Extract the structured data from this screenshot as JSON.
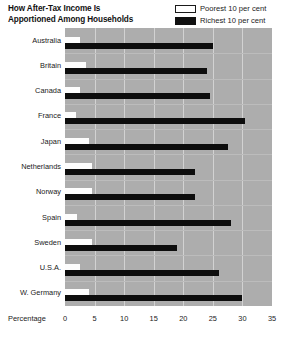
{
  "header": {
    "title_lines": [
      "How After-Tax Income Is",
      "Apportioned Among Households"
    ],
    "legend": [
      {
        "label": "Poorest 10 per cent",
        "swatch": "hollow-white-box",
        "color": "#ffffff"
      },
      {
        "label": "Richest 10 per cent",
        "swatch": "solid-black-box",
        "color": "#111111"
      }
    ]
  },
  "axis": {
    "title": "Percentage",
    "ticks": [
      "0",
      "5",
      "10",
      "15",
      "20",
      "25",
      "30",
      "35"
    ]
  },
  "colors": {
    "plot_background": "#adadad",
    "gridline": "#d2d2d2",
    "poorest_bar": "#fdfdfd",
    "richest_bar": "#0d0d0d",
    "text": "#1a1a1a"
  },
  "chart_data": {
    "type": "bar",
    "orientation": "horizontal",
    "title": "How After-Tax Income Is Apportioned Among Households",
    "xlabel": "Percentage",
    "ylabel": "",
    "xlim": [
      0,
      35
    ],
    "xticks": [
      0,
      5,
      10,
      15,
      20,
      25,
      30,
      35
    ],
    "grid": true,
    "legend_position": "top-right",
    "categories": [
      "Australia",
      "Britain",
      "Canada",
      "France",
      "Japan",
      "Netherlands",
      "Norway",
      "Spain",
      "Sweden",
      "U.S.A.",
      "W. Germany"
    ],
    "series": [
      {
        "name": "Poorest 10 per cent",
        "color": "#ffffff",
        "values": [
          2.5,
          3.5,
          2.5,
          1.8,
          4.0,
          4.5,
          4.5,
          2.0,
          4.5,
          2.5,
          4.0
        ]
      },
      {
        "name": "Richest 10 per cent",
        "color": "#111111",
        "values": [
          25.0,
          24.0,
          24.5,
          30.5,
          27.5,
          22.0,
          22.0,
          28.0,
          19.0,
          26.0,
          30.0
        ]
      }
    ]
  }
}
